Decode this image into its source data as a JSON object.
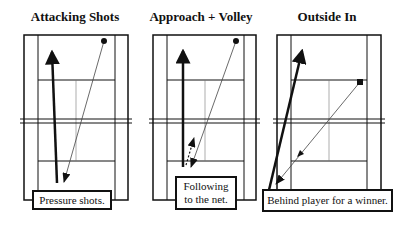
{
  "panels": [
    {
      "title": "Attacking Shots",
      "label": "Pressure shots.",
      "title_cx": 75,
      "court": {
        "x1": 24,
        "x2": 128,
        "in1": 38,
        "in2": 115,
        "top": 35,
        "bottom": 200
      },
      "thick_arrow": {
        "x1": 57,
        "y1": 183,
        "x2": 52,
        "y2": 49
      },
      "ball": {
        "x": 104,
        "y": 41
      },
      "thin_arrow": {
        "x1": 104,
        "y1": 41,
        "x2": 64,
        "y2": 182
      },
      "label_box": {
        "x": 32,
        "y": 190,
        "w": 80,
        "h": 20
      }
    },
    {
      "title": "Approach + Volley",
      "label_line1": "Following",
      "label_line2": "to the net.",
      "title_cx": 201,
      "court": {
        "x1": 153,
        "x2": 256,
        "in1": 167,
        "in2": 244,
        "top": 35,
        "bottom": 200
      },
      "thick_arrow": {
        "x1": 183,
        "y1": 167,
        "x2": 183,
        "y2": 48
      },
      "ball": {
        "x": 236,
        "y": 41
      },
      "thin_arrow": {
        "x1": 236,
        "y1": 41,
        "x2": 191,
        "y2": 167
      },
      "dashed_arrow": {
        "x1": 186,
        "y1": 165,
        "x2": 194,
        "y2": 138
      },
      "label_box": {
        "x": 175,
        "y": 176,
        "w": 62,
        "h": 34
      }
    },
    {
      "title": "Outside In",
      "label": "Behind player for a winner.",
      "title_cx": 327,
      "court": {
        "x1": 277,
        "x2": 381,
        "in1": 291,
        "in2": 367,
        "top": 35,
        "bottom": 200
      },
      "thick_arrow": {
        "x1": 269,
        "y1": 190,
        "x2": 303,
        "y2": 48
      },
      "ball": {
        "x": 360,
        "y": 82
      },
      "thin_arrow": {
        "x1": 360,
        "y1": 82,
        "x2": 276,
        "y2": 184
      },
      "label_box": {
        "x": 262,
        "y": 189,
        "w": 131,
        "h": 23
      }
    }
  ],
  "colors": {
    "line": "#111111",
    "thin_line": "#555555",
    "bg": "#ffffff"
  }
}
